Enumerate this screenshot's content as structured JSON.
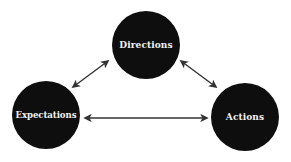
{
  "diagram": {
    "type": "cycle",
    "nodes": [
      {
        "id": "directions",
        "label": "Directions"
      },
      {
        "id": "expectations",
        "label": "Expectations"
      },
      {
        "id": "actions",
        "label": "Actions"
      }
    ],
    "edges": [
      {
        "from": "expectations",
        "to": "directions",
        "bidirectional": true
      },
      {
        "from": "directions",
        "to": "actions",
        "bidirectional": true
      },
      {
        "from": "expectations",
        "to": "actions",
        "bidirectional": true
      }
    ],
    "colors": {
      "node_fill": "#0e0e0e",
      "node_text": "#f2f2f2",
      "arrow": "#333333",
      "background": "#ffffff"
    }
  }
}
